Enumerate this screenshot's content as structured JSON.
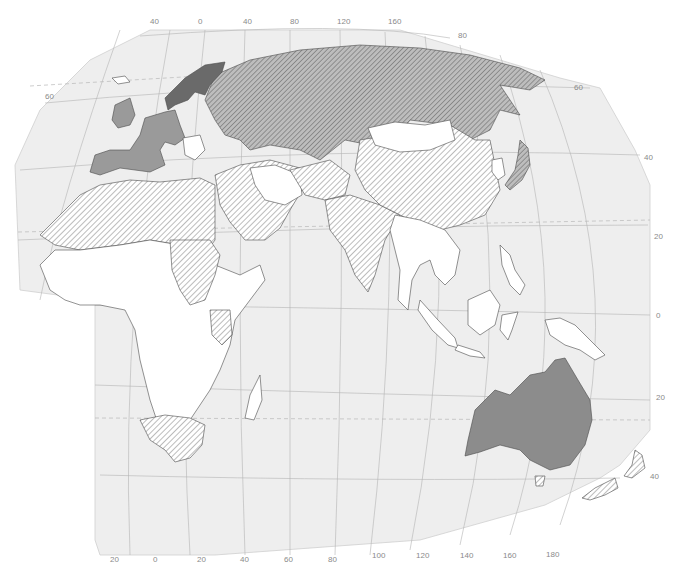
{
  "map": {
    "title": "",
    "projection": "Eastern Hemisphere outline map",
    "colors": {
      "sea": "#eeeeee",
      "unshaded_land": "#ffffff",
      "light_shade": "#9a9a9a",
      "dark_shade": "#6a6a6a",
      "australia_shade": "#8c8c8c",
      "hatched": "#7a7a7a",
      "graticule": "#b4b4b4"
    },
    "longitude_labels_top": [
      "40",
      "0",
      "40",
      "80",
      "120",
      "160"
    ],
    "longitude_labels_bottom": [
      "20",
      "0",
      "20",
      "40",
      "60",
      "80",
      "100",
      "120",
      "140",
      "160",
      "180"
    ],
    "latitude_labels_left": [
      "60"
    ],
    "latitude_labels_right": [
      "80",
      "60",
      "40",
      "20",
      "0",
      "20",
      "40"
    ],
    "legend": {
      "dark_solid": "Scandinavia / Northern Europe",
      "medium_solid": "Western & Central Europe, Australia",
      "hatched_dark": "Russia / Former USSR, Japan",
      "hatched_light": "North Africa, Middle East, China, India, Southern Africa, New Zealand",
      "white": "Sub-Saharan Africa, Mongolia, Southeast Asia, Indonesia"
    }
  }
}
